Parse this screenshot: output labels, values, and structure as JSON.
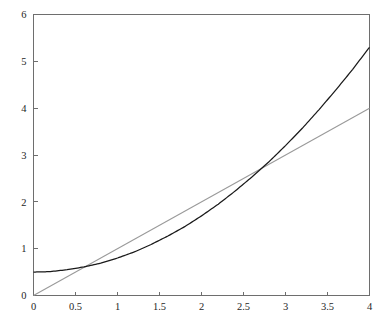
{
  "chart_data": {
    "type": "line",
    "title": "",
    "subtitle": "",
    "xlabel": "",
    "ylabel": "",
    "xlim": [
      0,
      4
    ],
    "ylim": [
      0,
      6
    ],
    "grid": false,
    "legend": "none",
    "xticks": [
      0,
      0.5,
      1,
      1.5,
      2,
      2.5,
      3,
      3.5,
      4
    ],
    "xtick_labels": [
      "0",
      "0.5",
      "1",
      "1.5",
      "2",
      "2.5",
      "3",
      "3.5",
      "4"
    ],
    "yticks": [
      0,
      1,
      2,
      3,
      4,
      5,
      6
    ],
    "ytick_labels": [
      "0",
      "1",
      "2",
      "3",
      "4",
      "5",
      "6"
    ],
    "series": [
      {
        "name": "quadratic-curve",
        "color": "#1a1a1a",
        "expression": "y = 0.5 + 0.3x^2",
        "x": [
          0,
          0.2,
          0.4,
          0.6,
          0.8,
          1,
          1.2,
          1.4,
          1.6,
          1.8,
          2,
          2.2,
          2.4,
          2.6,
          2.8,
          3,
          3.2,
          3.4,
          3.6,
          3.8,
          4
        ],
        "values": [
          0.5,
          0.51,
          0.55,
          0.61,
          0.69,
          0.8,
          0.93,
          1.09,
          1.27,
          1.47,
          1.7,
          1.95,
          2.23,
          2.53,
          2.85,
          3.2,
          3.57,
          3.97,
          4.39,
          4.83,
          5.3
        ]
      },
      {
        "name": "straight-line",
        "color": "#9a9a9a",
        "expression": "y = x",
        "x": [
          0,
          4
        ],
        "values": [
          0,
          4
        ]
      }
    ],
    "intersections": [
      {
        "x": 0.55,
        "y": 0.55
      },
      {
        "x": 2.61,
        "y": 2.61
      }
    ]
  },
  "axes": {
    "x_axis_name": "x-axis",
    "y_axis_name": "y-axis"
  }
}
